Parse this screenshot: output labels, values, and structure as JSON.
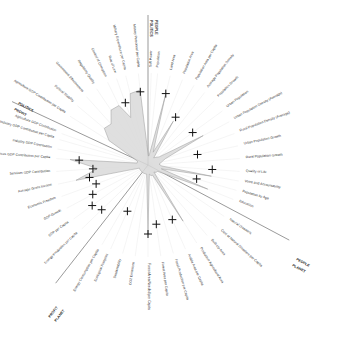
{
  "chart_data": {
    "type": "radar",
    "title": "",
    "center": [
      148,
      165
    ],
    "sections": [
      {
        "name": "PEOPLE",
        "boundary_axis_angle": -90
      },
      {
        "name": "POLITICS",
        "boundary_axis_angle": -90
      },
      {
        "name": "PLANET",
        "boundary_axis_angle": 28
      },
      {
        "name": "PEOPLE",
        "boundary_axis_angle": 28
      },
      {
        "name": "PROFIT",
        "boundary_axis_angle": 128
      },
      {
        "name": "PLANET",
        "boundary_axis_angle": 128
      },
      {
        "name": "POLITICS",
        "boundary_axis_angle": 205
      },
      {
        "name": "PROFIT",
        "boundary_axis_angle": 205
      }
    ],
    "axes": [
      {
        "label": "Population",
        "angle": -84,
        "value": 0.1,
        "target": null
      },
      {
        "label": "Land Area",
        "angle": -76,
        "value": 0.78,
        "target": 0.8
      },
      {
        "label": "Population Area",
        "angle": -68,
        "value": 0.15,
        "target": null
      },
      {
        "label": "Population Area per Capita",
        "angle": -60,
        "value": 0.55,
        "target": 0.6
      },
      {
        "label": "Average Population Density",
        "angle": -52,
        "value": 0.1,
        "target": null
      },
      {
        "label": "Population Growth",
        "angle": -44,
        "value": 0.12,
        "target": null
      },
      {
        "label": "Urban Population",
        "angle": -36,
        "value": 0.15,
        "target": 0.6
      },
      {
        "label": "Urban Population Density (Average)",
        "angle": -28,
        "value": 0.68,
        "target": null
      },
      {
        "label": "Rural Population Density (Average)",
        "angle": -20,
        "value": 0.2,
        "target": null
      },
      {
        "label": "Urban Population Growth",
        "angle": -12,
        "value": 0.15,
        "target": 0.55
      },
      {
        "label": "Rural Population Growth",
        "angle": -4,
        "value": 0.12,
        "target": null
      },
      {
        "label": "Quality of Life",
        "angle": 4,
        "value": 0.15,
        "target": 0.7
      },
      {
        "label": "Voice and Accountability",
        "angle": 10,
        "value": 0.7,
        "target": null
      },
      {
        "label": "Population by Age",
        "angle": 16,
        "value": 0.15,
        "target": 0.55
      },
      {
        "label": "Education",
        "angle": 22,
        "value": 0.7,
        "target": null
      },
      {
        "label": "Natural Disasters",
        "angle": 34,
        "value": 0.12,
        "target": null
      },
      {
        "label": "Cost of Natural Disasters per Capita",
        "angle": 42,
        "value": 0.12,
        "target": null
      },
      {
        "label": "Built-Up Area",
        "angle": 50,
        "value": 0.1,
        "target": null
      },
      {
        "label": "Productive Agricultural Area",
        "angle": 58,
        "value": 0.72,
        "target": null
      },
      {
        "label": "Arable Area per Capita",
        "angle": 66,
        "value": 0.12,
        "target": 0.65
      },
      {
        "label": "Fossil Production per Capita",
        "angle": 74,
        "value": 0.12,
        "target": null
      },
      {
        "label": "Forest Area per Capita",
        "angle": 82,
        "value": 0.1,
        "target": 0.65
      },
      {
        "label": "Forest Area Needed per Capita",
        "angle": 90,
        "value": 0.75,
        "target": 0.75
      },
      {
        "label": "CO2 Emissions",
        "angle": 98,
        "value": 0.1,
        "target": null
      },
      {
        "label": "Sustainability",
        "angle": 106,
        "value": 0.1,
        "target": null
      },
      {
        "label": "Ecological Footprint",
        "angle": 114,
        "value": 0.1,
        "target": 0.55
      },
      {
        "label": "Energy Consumption per Capita",
        "angle": 120,
        "value": 0.1,
        "target": null
      },
      {
        "label": "Energy Production per Capita",
        "angle": 136,
        "value": 0.1,
        "target": 0.7
      },
      {
        "label": "GDP per Capita",
        "angle": 144,
        "value": 0.1,
        "target": 0.75
      },
      {
        "label": "GDP Growth",
        "angle": 152,
        "value": 0.1,
        "target": 0.68
      },
      {
        "label": "Economic Freedom",
        "angle": 160,
        "value": 0.1,
        "target": 0.6
      },
      {
        "label": "Average Gross Income",
        "angle": 168,
        "value": 0.8,
        "target": 0.65
      },
      {
        "label": "Services GDP Contribution",
        "angle": 176,
        "value": 0.55,
        "target": 0.6
      },
      {
        "label": "Services GDP Contribution per Capita",
        "angle": 184,
        "value": 0.85,
        "target": 0.75
      },
      {
        "label": "Industry GDP Contribution",
        "angle": 190,
        "value": 0.12,
        "target": null
      },
      {
        "label": "Industry GDP Contribution per Capita",
        "angle": 196,
        "value": 0.12,
        "target": null
      },
      {
        "label": "Agriculture GDP Contribution",
        "angle": 200,
        "value": 0.12,
        "target": null
      },
      {
        "label": "Agriculture GDP Contribution per Capita",
        "angle": 212,
        "value": 0.5,
        "target": null
      },
      {
        "label": "Political Stability",
        "angle": 220,
        "value": 0.62,
        "target": null
      },
      {
        "label": "Government Effectiveness",
        "angle": 228,
        "value": 0.6,
        "target": null
      },
      {
        "label": "Regulatory Quality",
        "angle": 236,
        "value": 0.72,
        "target": null
      },
      {
        "label": "Control of Corruption",
        "angle": 244,
        "value": 0.72,
        "target": null
      },
      {
        "label": "Rule of Law",
        "angle": 250,
        "value": 0.55,
        "target": 0.72
      },
      {
        "label": "Military Expenditure per Capita",
        "angle": 256,
        "value": 0.8,
        "target": null
      },
      {
        "label": "Military Personnel per Capita",
        "angle": 264,
        "value": 0.82,
        "target": 0.8
      },
      {
        "label": "Soft Power",
        "angle": 272,
        "value": 0.1,
        "target": null
      }
    ],
    "radius": 92,
    "grid": false,
    "legend": null
  },
  "section_labels": {
    "top_left": "POLITICS",
    "top_right": "PEOPLE",
    "left_upper": "POLITICS",
    "left_lower": "PROFIT",
    "right_upper": "PEOPLE",
    "right_lower": "PLANET",
    "bottom_left_a": "PROFIT",
    "bottom_left_b": "PLANET"
  }
}
